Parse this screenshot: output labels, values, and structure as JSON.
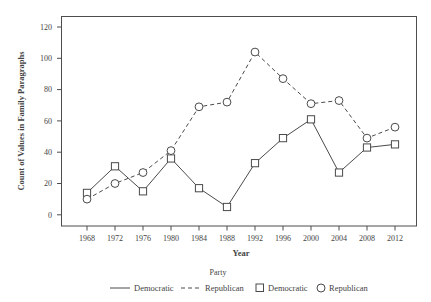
{
  "chart_data": {
    "type": "line",
    "title": "",
    "xlabel": "Year",
    "ylabel": "Count of Values in Family Paragraphs",
    "categories": [
      1968,
      1972,
      1976,
      1980,
      1984,
      1988,
      1992,
      1996,
      2000,
      2004,
      2008,
      2012
    ],
    "xticklabels": [
      "1968",
      "1972",
      "1976",
      "1980",
      "1984",
      "1988",
      "1992",
      "1996",
      "2000",
      "2004",
      "2008",
      "2012"
    ],
    "yticklabels": [
      "0",
      "20",
      "40",
      "60",
      "80",
      "100",
      "120"
    ],
    "yticks": [
      0,
      20,
      40,
      60,
      80,
      100,
      120
    ],
    "ylim": [
      -6,
      126
    ],
    "xlim": [
      1966,
      2014
    ],
    "grid": false,
    "series": [
      {
        "name": "Democratic",
        "marker": "square",
        "linestyle": "solid",
        "color": "#4a4a4a",
        "values": [
          14,
          31,
          15,
          36,
          17,
          5,
          33,
          49,
          61,
          27,
          43,
          45
        ]
      },
      {
        "name": "Republican",
        "marker": "circle",
        "linestyle": "dashed",
        "color": "#4a4a4a",
        "values": [
          10,
          20,
          27,
          41,
          69,
          72,
          104,
          87,
          71,
          73,
          49,
          56
        ]
      }
    ],
    "legend": {
      "title": "Party",
      "position": "bottom",
      "entries": [
        {
          "label": "Democratic",
          "glyph": "solid-line"
        },
        {
          "label": "Republican",
          "glyph": "dashed-line"
        },
        {
          "label": "Democratic",
          "glyph": "square"
        },
        {
          "label": "Republican",
          "glyph": "circle"
        }
      ]
    }
  },
  "axes": {
    "x_title": "Year",
    "y_title": "Count of Values in Family Paragraphs"
  },
  "legend": {
    "title": "Party",
    "entry_0_label": "Democratic",
    "entry_1_label": "Republican",
    "entry_2_label": "Democratic",
    "entry_3_label": "Republican"
  },
  "ylabels": {
    "t0": "0",
    "t1": "20",
    "t2": "40",
    "t3": "60",
    "t4": "80",
    "t5": "100",
    "t6": "120"
  },
  "xlabels": {
    "t0": "1968",
    "t1": "1972",
    "t2": "1976",
    "t3": "1980",
    "t4": "1984",
    "t5": "1988",
    "t6": "1992",
    "t7": "1996",
    "t8": "2000",
    "t9": "2004",
    "t10": "2008",
    "t11": "2012"
  }
}
